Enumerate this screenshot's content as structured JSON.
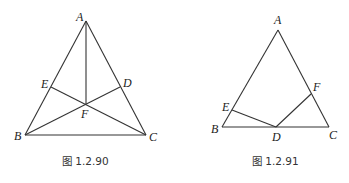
{
  "figures": [
    {
      "caption": "图 1.2.90",
      "points": {
        "A": {
          "label": "A",
          "x": 86,
          "y": 21
        },
        "B": {
          "label": "B",
          "x": 25,
          "y": 135
        },
        "C": {
          "label": "C",
          "x": 146,
          "y": 135
        },
        "D": {
          "label": "D",
          "x": 120,
          "y": 87
        },
        "E": {
          "label": "E",
          "x": 51,
          "y": 87
        },
        "F": {
          "label": "F",
          "x": 86,
          "y": 104
        }
      },
      "segments": [
        "AB",
        "BC",
        "CA",
        "AF",
        "BD",
        "CE"
      ]
    },
    {
      "caption": "图 1.2.91",
      "points": {
        "A": {
          "label": "A",
          "x": 278,
          "y": 30
        },
        "B": {
          "label": "B",
          "x": 222,
          "y": 127
        },
        "C": {
          "label": "C",
          "x": 329,
          "y": 127
        },
        "D": {
          "label": "D",
          "x": 276,
          "y": 127
        },
        "E": {
          "label": "E",
          "x": 232,
          "y": 110
        },
        "F": {
          "label": "F",
          "x": 311,
          "y": 94
        }
      },
      "segments": [
        "AB",
        "BC",
        "CA",
        "ED",
        "DF"
      ]
    }
  ]
}
